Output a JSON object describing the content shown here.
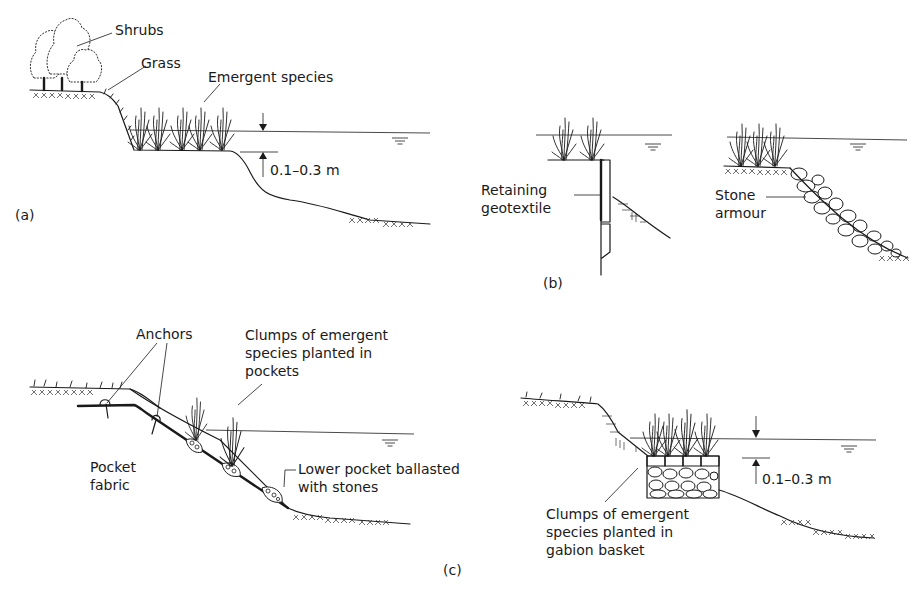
{
  "figure": {
    "colors": {
      "ink": "#1a1a1a",
      "background": "#ffffff"
    },
    "panels": [
      {
        "id": "a",
        "label": "(a)",
        "annotations": {
          "shrubs": "Shrubs",
          "grass": "Grass",
          "emergent": "Emergent species",
          "depth": "0.1–0.3 m"
        }
      },
      {
        "id": "b",
        "label": "(b)",
        "annotations": {
          "retaining_line1": "Retaining",
          "retaining_line2": "geotextile",
          "stone_line1": "Stone",
          "stone_line2": "armour"
        }
      },
      {
        "id": "c",
        "label": "(c)",
        "annotations": {
          "anchors": "Anchors",
          "clumps_pockets_line1": "Clumps of emergent",
          "clumps_pockets_line2": "species planted in",
          "clumps_pockets_line3": "pockets",
          "pocket_fabric_line1": "Pocket",
          "pocket_fabric_line2": "fabric",
          "lower_pocket_line1": "Lower pocket ballasted",
          "lower_pocket_line2": "with stones",
          "gabion_line1": "Clumps of emergent",
          "gabion_line2": "species planted in",
          "gabion_line3": "gabion basket",
          "depth": "0.1–0.3 m"
        }
      }
    ],
    "icons": [
      "water-level-symbol",
      "depth-arrow-down",
      "depth-arrow-up"
    ]
  }
}
